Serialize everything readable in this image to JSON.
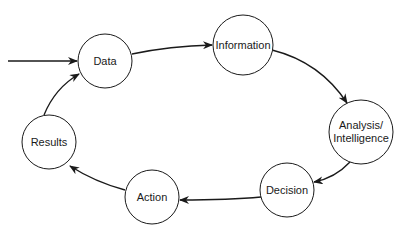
{
  "diagram": {
    "type": "cycle",
    "colors": {
      "stroke": "#1a1a1a",
      "fill": "#ffffff",
      "text": "#1a1a1a"
    },
    "entry_arrow": {
      "from": [
        8,
        61
      ],
      "to": [
        78,
        61
      ],
      "target": "data"
    },
    "nodes": [
      {
        "id": "data",
        "label": "Data",
        "cx": 105,
        "cy": 61,
        "r": 27
      },
      {
        "id": "information",
        "label": "Information",
        "cx": 243,
        "cy": 45,
        "r": 30
      },
      {
        "id": "analysis",
        "label": "Analysis/\nIntelligence",
        "label_line1": "Analysis/",
        "label_line2": "Intelligence",
        "cx": 361,
        "cy": 132,
        "r": 32
      },
      {
        "id": "decision",
        "label": "Decision",
        "cx": 287,
        "cy": 190,
        "r": 27
      },
      {
        "id": "action",
        "label": "Action",
        "cx": 152,
        "cy": 197,
        "r": 27
      },
      {
        "id": "results",
        "label": "Results",
        "cx": 49,
        "cy": 142,
        "r": 27
      }
    ],
    "edges": [
      {
        "from": "data",
        "to": "information"
      },
      {
        "from": "information",
        "to": "analysis"
      },
      {
        "from": "analysis",
        "to": "decision"
      },
      {
        "from": "decision",
        "to": "action"
      },
      {
        "from": "action",
        "to": "results"
      },
      {
        "from": "results",
        "to": "data"
      }
    ]
  }
}
